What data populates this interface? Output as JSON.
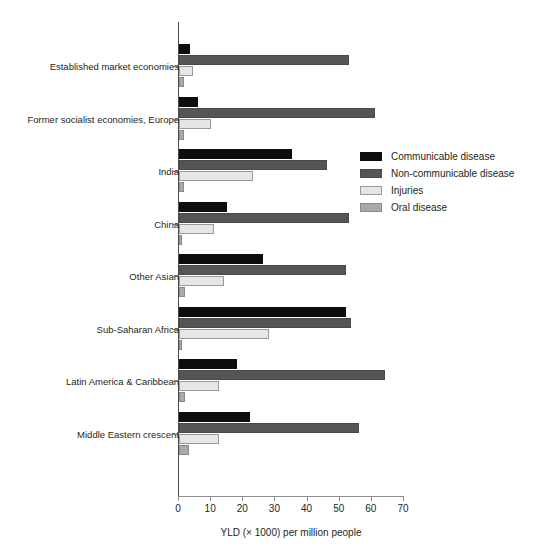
{
  "chart_data": {
    "type": "bar",
    "orientation": "horizontal",
    "title": "",
    "xlabel": "YLD (× 1000) per million people",
    "ylabel": "",
    "xlim": [
      0,
      70
    ],
    "xticks": [
      0,
      10,
      20,
      30,
      40,
      50,
      60,
      70
    ],
    "xtick_labels": [
      "0",
      "10",
      "20",
      "30",
      "40",
      "50",
      "60",
      "70"
    ],
    "grid": false,
    "legend_position": "center-right",
    "categories": [
      "Established market economies",
      "Former socialist economies, Europe",
      "India",
      "China",
      "Other Asian",
      "Sub-Saharan Africa",
      "Latin America & Caribbean",
      "Middle Eastern crescent"
    ],
    "series": [
      {
        "name": "Communicable disease",
        "color": "#0d0d0d",
        "values": [
          3.5,
          6.0,
          35.0,
          15.0,
          26.0,
          52.0,
          18.0,
          22.0
        ]
      },
      {
        "name": "Non-communicable disease",
        "color": "#555555",
        "values": [
          53.0,
          61.0,
          46.0,
          53.0,
          52.0,
          53.5,
          64.0,
          56.0
        ]
      },
      {
        "name": "Injuries",
        "color": "#e6e6e6",
        "values": [
          4.5,
          10.0,
          23.0,
          11.0,
          14.0,
          28.0,
          12.5,
          12.5
        ]
      },
      {
        "name": "Oral disease",
        "color": "#aaaaaa",
        "values": [
          1.5,
          1.5,
          1.5,
          1.0,
          2.0,
          1.0,
          2.0,
          3.0
        ]
      }
    ]
  }
}
